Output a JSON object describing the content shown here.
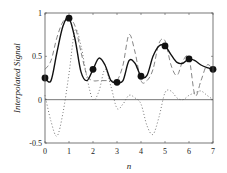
{
  "chart_data": {
    "type": "line",
    "title": "",
    "xlabel": "n",
    "ylabel": "Interpolated Signal",
    "xlim": [
      0,
      7
    ],
    "ylim": [
      -0.5,
      1
    ],
    "xticks": [
      0,
      1,
      2,
      3,
      4,
      5,
      6,
      7
    ],
    "xtick_labels": [
      "0",
      "1",
      "2",
      "3",
      "4",
      "5",
      "6",
      "7"
    ],
    "yticks": [
      -0.5,
      0,
      0.5,
      1
    ],
    "ytick_labels": [
      "-0.5",
      "0",
      "0.5",
      "1"
    ],
    "grid": false,
    "legend": null,
    "zero_line": true,
    "samples": {
      "name": "Samples",
      "marker": "filled-circle",
      "x": [
        0,
        1,
        2,
        3,
        4,
        5,
        6,
        7
      ],
      "y": [
        0.25,
        0.94,
        0.35,
        0.2,
        0.27,
        0.62,
        0.47,
        0.35
      ]
    },
    "series": [
      {
        "name": "Interpolated (solid)",
        "style": "solid",
        "x": [
          0,
          0.25,
          0.5,
          0.75,
          1,
          1.25,
          1.5,
          1.75,
          2,
          2.25,
          2.5,
          2.75,
          3,
          3.25,
          3.5,
          3.75,
          4,
          4.25,
          4.5,
          4.75,
          5,
          5.25,
          5.5,
          5.75,
          6,
          6.25,
          6.5,
          6.75,
          7
        ],
        "y": [
          0.25,
          0.22,
          0.55,
          0.85,
          0.94,
          0.7,
          0.32,
          0.22,
          0.35,
          0.48,
          0.4,
          0.22,
          0.2,
          0.22,
          0.45,
          0.42,
          0.27,
          0.28,
          0.5,
          0.62,
          0.62,
          0.52,
          0.43,
          0.42,
          0.47,
          0.45,
          0.4,
          0.37,
          0.35
        ]
      },
      {
        "name": "Dashed",
        "style": "dashed",
        "x": [
          0,
          0.25,
          0.5,
          0.75,
          1,
          1.25,
          1.5,
          1.75,
          2,
          2.25,
          2.5,
          2.75,
          3,
          3.25,
          3.5,
          3.75,
          4,
          4.25,
          4.5,
          4.75,
          5,
          5.25,
          5.5,
          5.75,
          6,
          6.25,
          6.5,
          6.75,
          7
        ],
        "y": [
          0.35,
          0.45,
          0.72,
          0.9,
          0.93,
          0.85,
          0.55,
          0.28,
          0.22,
          0.22,
          0.22,
          0.22,
          0.22,
          0.4,
          0.75,
          0.55,
          0.22,
          0.22,
          0.35,
          0.65,
          0.68,
          0.4,
          0.28,
          0.45,
          0.48,
          0.05,
          0.22,
          0.4,
          0.35
        ]
      },
      {
        "name": "Dotted",
        "style": "dotted",
        "x": [
          0,
          0.25,
          0.5,
          0.75,
          1,
          1.25,
          1.5,
          1.75,
          2,
          2.25,
          2.5,
          2.75,
          3,
          3.25,
          3.5,
          3.75,
          4,
          4.25,
          4.5,
          4.75,
          5,
          5.25,
          5.5,
          5.75,
          6,
          6.25,
          6.5,
          6.75,
          7
        ],
        "y": [
          0.05,
          -0.25,
          -0.42,
          -0.15,
          0.3,
          0.8,
          0.62,
          0.25,
          0.0,
          0.1,
          0.35,
          0.15,
          -0.1,
          -0.05,
          0.05,
          0.02,
          -0.05,
          -0.3,
          -0.4,
          -0.2,
          0.08,
          0.1,
          0.02,
          0.0,
          0.05,
          0.08,
          0.1,
          0.05,
          0.0
        ]
      }
    ]
  }
}
